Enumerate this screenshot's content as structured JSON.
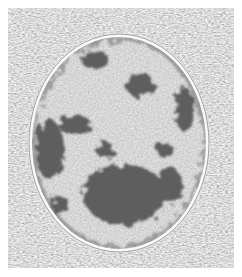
{
  "figure": {
    "style": "grayscale engraving",
    "colors": {
      "background": "#ffffff",
      "cytoplasm": "#c8c8c8",
      "nucleoplasm": "#eeeeee",
      "chromatin": "#4a4a4a",
      "membrane": "#f4f4f4"
    },
    "nucleus": {
      "cx": 119,
      "cy": 143,
      "rx": 88,
      "ry": 107
    },
    "chromatin_blobs": [
      {
        "cx": 125,
        "cy": 195,
        "rx": 42,
        "ry": 30
      },
      {
        "cx": 140,
        "cy": 85,
        "rx": 14,
        "ry": 12
      },
      {
        "cx": 50,
        "cy": 150,
        "rx": 14,
        "ry": 30
      },
      {
        "cx": 185,
        "cy": 110,
        "rx": 10,
        "ry": 22
      },
      {
        "cx": 75,
        "cy": 125,
        "rx": 16,
        "ry": 10
      },
      {
        "cx": 170,
        "cy": 185,
        "rx": 12,
        "ry": 18
      },
      {
        "cx": 95,
        "cy": 60,
        "rx": 14,
        "ry": 9
      },
      {
        "cx": 105,
        "cy": 150,
        "rx": 9,
        "ry": 8
      },
      {
        "cx": 165,
        "cy": 150,
        "rx": 9,
        "ry": 7
      },
      {
        "cx": 60,
        "cy": 205,
        "rx": 10,
        "ry": 9
      }
    ]
  },
  "caption": ""
}
